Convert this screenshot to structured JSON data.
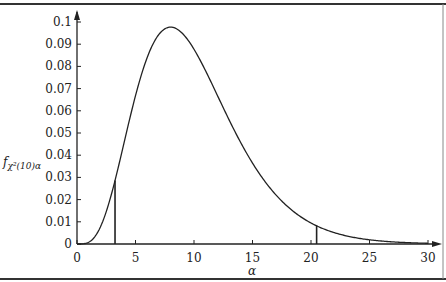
{
  "chart_data": {
    "type": "line",
    "title": "",
    "xlabel": "α",
    "ylabel": "f_{χ²(10)α}",
    "ylabel_main": "f",
    "ylabel_sub": "χ²(10)α",
    "xlim": [
      0,
      30
    ],
    "ylim": [
      0,
      0.1
    ],
    "x_ticks": [
      "0",
      "5",
      "10",
      "15",
      "20",
      "25",
      "30"
    ],
    "y_ticks": [
      "0",
      "0.01",
      "0.02",
      "0.03",
      "0.04",
      "0.05",
      "0.06",
      "0.07",
      "0.08",
      "0.09",
      "0.1"
    ],
    "grid": false,
    "legend": null,
    "series": [
      {
        "name": "chi-square pdf, 10 degrees of freedom",
        "x": [
          0,
          1,
          2,
          3,
          4,
          5,
          6,
          7,
          8,
          9,
          10,
          11,
          12,
          13,
          14,
          15,
          16,
          17,
          18,
          19,
          20,
          21,
          22,
          23,
          24,
          25,
          26,
          27,
          28,
          29,
          30
        ],
        "values": [
          0,
          0.0008,
          0.0077,
          0.0235,
          0.0451,
          0.0668,
          0.084,
          0.0944,
          0.0977,
          0.0948,
          0.0877,
          0.0777,
          0.0664,
          0.0551,
          0.0446,
          0.0353,
          0.0275,
          0.021,
          0.0158,
          0.0117,
          0.0087,
          0.0063,
          0.0045,
          0.0032,
          0.0023,
          0.0016,
          0.0011,
          0.0008,
          0.0005,
          0.0004,
          0.0002
        ]
      }
    ],
    "annotations": [
      {
        "type": "vertical-line",
        "x": 3.25,
        "y": 0.032,
        "label": "lower critical value"
      },
      {
        "type": "vertical-line",
        "x": 20.48,
        "y": 0.0075,
        "label": "upper critical value"
      }
    ]
  }
}
